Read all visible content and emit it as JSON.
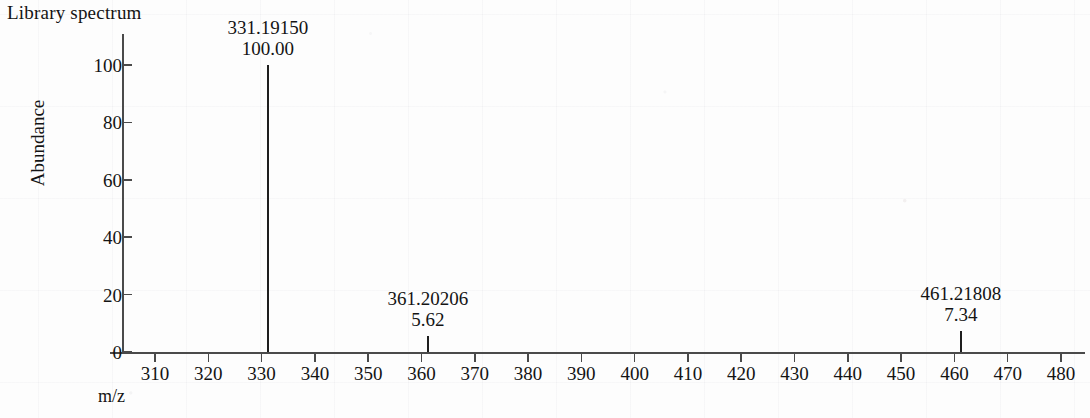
{
  "title": "Library spectrum",
  "chart_data": {
    "type": "bar",
    "title": "Library spectrum",
    "xlabel": "m/z",
    "ylabel": "Abundance",
    "xlim": [
      303,
      492
    ],
    "ylim": [
      0,
      105
    ],
    "grid": false,
    "legend": "none",
    "x_ticks": [
      "310",
      "320",
      "330",
      "340",
      "350",
      "360",
      "370",
      "380",
      "390",
      "400",
      "410",
      "420",
      "430",
      "440",
      "450",
      "460",
      "470",
      "480"
    ],
    "x_tick_values": [
      310,
      320,
      330,
      340,
      350,
      360,
      370,
      380,
      390,
      400,
      410,
      420,
      430,
      440,
      450,
      460,
      470,
      480
    ],
    "x_extra_tick_value": 490,
    "y_ticks": [
      "0",
      "20",
      "40",
      "60",
      "80",
      "100"
    ],
    "y_tick_values": [
      0,
      20,
      40,
      60,
      80,
      100
    ],
    "peaks": [
      {
        "mz_label": "331.19150",
        "intensity_label": "100.00",
        "mz": 331.1915,
        "intensity": 100.0
      },
      {
        "mz_label": "361.20206",
        "intensity_label": "5.62",
        "mz": 361.20206,
        "intensity": 5.62
      },
      {
        "mz_label": "461.21808",
        "intensity_label": "7.34",
        "mz": 461.21808,
        "intensity": 7.34
      }
    ],
    "series": [
      {
        "name": "Library spectrum",
        "x": [
          331.1915,
          361.20206,
          461.21808
        ],
        "values": [
          100.0,
          5.62,
          7.34
        ]
      }
    ]
  },
  "colors": {
    "axis": "#4a4a4a",
    "peak": "#1e1e1e",
    "text": "#141414",
    "background": "#fdfdfd"
  }
}
